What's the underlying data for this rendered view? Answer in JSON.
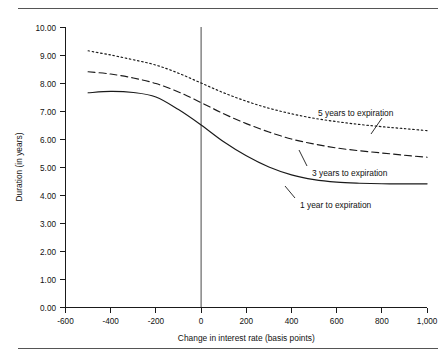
{
  "figure": {
    "top_rule": "horizontal-rule",
    "bottom_rule": "horizontal-rule"
  },
  "chart_data": {
    "type": "line",
    "title": "",
    "xlabel": "Change in interest rate (basis points)",
    "ylabel": "Duration (in years)",
    "xlim": [
      -600,
      1000
    ],
    "ylim": [
      0.0,
      10.0
    ],
    "xticks": [
      -600,
      -400,
      -200,
      0,
      200,
      400,
      600,
      800,
      1000
    ],
    "xtick_labels": [
      "-600",
      "-400",
      "-200",
      "0",
      "200",
      "400",
      "600",
      "800",
      "1,000"
    ],
    "yticks": [
      0.0,
      1.0,
      2.0,
      3.0,
      4.0,
      5.0,
      6.0,
      7.0,
      8.0,
      9.0,
      10.0
    ],
    "ytick_labels": [
      "0.00",
      "1.00",
      "2.00",
      "3.00",
      "4.00",
      "5.00",
      "6.00",
      "7.00",
      "8.00",
      "9.00",
      "10.00"
    ],
    "grid": false,
    "legend_position": "inline-annotations",
    "reference_lines": [
      {
        "name": "zero-basis-point-line",
        "axis": "x",
        "value": 0
      }
    ],
    "x": [
      -500,
      -400,
      -300,
      -200,
      -100,
      0,
      100,
      200,
      300,
      400,
      500,
      600,
      700,
      800,
      900,
      1000
    ],
    "series": [
      {
        "name": "5 years to expiration",
        "style": "dotted",
        "label": "5 years to expiration",
        "values": [
          9.15,
          9.0,
          8.83,
          8.64,
          8.35,
          8.0,
          7.65,
          7.35,
          7.1,
          6.9,
          6.74,
          6.62,
          6.52,
          6.44,
          6.37,
          6.3
        ]
      },
      {
        "name": "3 years to expiration",
        "style": "dashed",
        "label": "3 years to expiration",
        "values": [
          8.4,
          8.32,
          8.18,
          7.98,
          7.68,
          7.3,
          6.9,
          6.55,
          6.25,
          6.0,
          5.82,
          5.68,
          5.58,
          5.5,
          5.42,
          5.35
        ]
      },
      {
        "name": "1 year to expiration",
        "style": "solid",
        "label": "1 year to expiration",
        "values": [
          7.65,
          7.7,
          7.66,
          7.5,
          7.05,
          6.5,
          5.9,
          5.4,
          5.0,
          4.72,
          4.55,
          4.46,
          4.42,
          4.4,
          4.4,
          4.4
        ]
      }
    ],
    "annotations": [
      {
        "name": "annotation-5-years",
        "text": "5 years to expiration",
        "x": 560,
        "y": 6.72,
        "anchor": "start"
      },
      {
        "name": "annotation-3-years",
        "text": "3 years to expiration",
        "x": 560,
        "y": 5.78,
        "anchor": "start"
      },
      {
        "name": "annotation-1-year",
        "text": "1 year to expiration",
        "x": 505,
        "y": 4.78,
        "anchor": "start"
      }
    ]
  }
}
